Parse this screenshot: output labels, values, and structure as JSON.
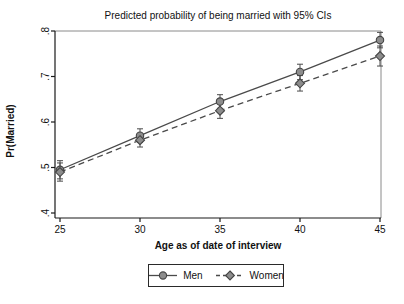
{
  "chart_data": {
    "type": "line",
    "title": "Predicted probability of being married with 95% CIs",
    "xlabel": "Age as of date of interview",
    "ylabel": "Pr(Married)",
    "xlim": [
      25,
      45
    ],
    "ylim": [
      0.4,
      0.8
    ],
    "x_ticks": [
      "25",
      "30",
      "35",
      "40",
      "45"
    ],
    "x_tick_values": [
      25,
      30,
      35,
      40,
      45
    ],
    "y_ticks": [
      ".4",
      ".5",
      ".6",
      ".7",
      ".8"
    ],
    "y_tick_values": [
      0.4,
      0.5,
      0.6,
      0.7,
      0.8
    ],
    "grid": false,
    "legend_position": "bottom-center",
    "x": [
      25,
      30,
      35,
      40,
      45
    ],
    "series": [
      {
        "name": "Men",
        "marker": "circle",
        "line_style": "solid",
        "values": [
          0.495,
          0.57,
          0.645,
          0.71,
          0.78
        ],
        "ci_halfwidth": [
          0.02,
          0.015,
          0.015,
          0.017,
          0.017
        ]
      },
      {
        "name": "Women",
        "marker": "diamond",
        "line_style": "dashed",
        "values": [
          0.49,
          0.56,
          0.625,
          0.685,
          0.745
        ],
        "ci_halfwidth": [
          0.02,
          0.015,
          0.017,
          0.017,
          0.022
        ]
      }
    ],
    "colors": {
      "line": "#4a4a4a",
      "marker_fill": "#8c8c8c",
      "marker_stroke": "#444444",
      "error_bar": "#4a4a4a",
      "axis": "#1a1a1a",
      "frame": "#8a8a8a",
      "text": "#111111",
      "background": "#ffffff"
    }
  }
}
